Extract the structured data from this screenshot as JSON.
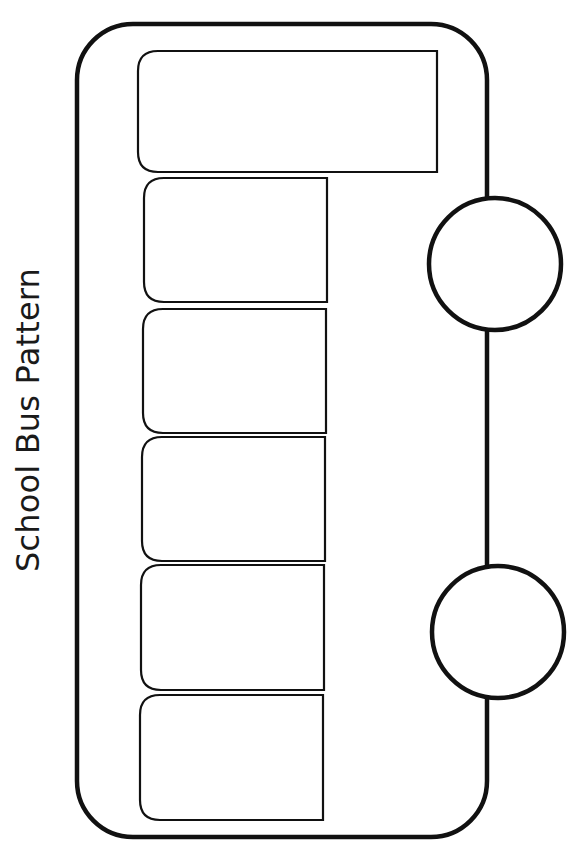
{
  "page": {
    "title": "School Bus Pattern"
  },
  "bus": {
    "stroke_color": "#111111",
    "fill_color": "#ffffff",
    "body": {
      "x": 77,
      "y": 24,
      "width": 410,
      "height": 813,
      "radius": 56
    },
    "windshield": {
      "x": 138,
      "y": 51,
      "width": 299,
      "height": 121,
      "radius": 20
    },
    "windows": [
      {
        "x": 144,
        "y": 178,
        "width": 183,
        "height": 124,
        "radius": 20
      },
      {
        "x": 143,
        "y": 309,
        "width": 183,
        "height": 124,
        "radius": 20
      },
      {
        "x": 142,
        "y": 437,
        "width": 183,
        "height": 124,
        "radius": 20
      },
      {
        "x": 141,
        "y": 565,
        "width": 183,
        "height": 125,
        "radius": 20
      },
      {
        "x": 140,
        "y": 695,
        "width": 183,
        "height": 125,
        "radius": 20
      }
    ],
    "wheels": [
      {
        "cx": 495,
        "cy": 264,
        "r": 66
      },
      {
        "cx": 498,
        "cy": 632,
        "r": 66
      }
    ]
  }
}
